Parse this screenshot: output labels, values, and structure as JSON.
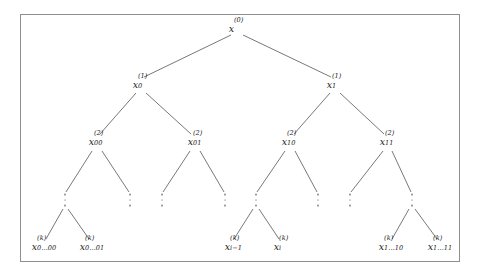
{
  "figure": {
    "frame_color": "#8e8e8e",
    "background_color": "#ffffff",
    "edge_color": "#555555",
    "text_color": "#1a1a1a",
    "width": 479,
    "height": 277
  },
  "tree": {
    "levels": [
      {
        "level": 0,
        "nodes": [
          {
            "id": "root",
            "base": "x",
            "sup": "(0)",
            "sub": "",
            "x": 236,
            "y": 29
          }
        ]
      },
      {
        "level": 1,
        "nodes": [
          {
            "id": "n0",
            "base": "x",
            "sup": "(1)",
            "sub": "0",
            "x": 140,
            "y": 85
          },
          {
            "id": "n1",
            "base": "x",
            "sup": "(1)",
            "sub": "1",
            "x": 334,
            "y": 85
          }
        ]
      },
      {
        "level": 2,
        "nodes": [
          {
            "id": "n00",
            "base": "x",
            "sup": "(2)",
            "sub": "00",
            "x": 96,
            "y": 142
          },
          {
            "id": "n01",
            "base": "x",
            "sup": "(2)",
            "sub": "01",
            "x": 195,
            "y": 142
          },
          {
            "id": "n10",
            "base": "x",
            "sup": "(2)",
            "sub": "10",
            "x": 289,
            "y": 142
          },
          {
            "id": "n11",
            "base": "x",
            "sup": "(2)",
            "sub": "11",
            "x": 387,
            "y": 142
          }
        ]
      }
    ],
    "dots": [
      {
        "id": "d1",
        "x": 65,
        "y": 200
      },
      {
        "id": "d2",
        "x": 130,
        "y": 200
      },
      {
        "id": "d3",
        "x": 162,
        "y": 200
      },
      {
        "id": "d4",
        "x": 225,
        "y": 200
      },
      {
        "id": "d5",
        "x": 256,
        "y": 200
      },
      {
        "id": "d6",
        "x": 318,
        "y": 200
      },
      {
        "id": "d7",
        "x": 350,
        "y": 200
      },
      {
        "id": "d8",
        "x": 412,
        "y": 200
      }
    ],
    "leaves": [
      {
        "id": "l1",
        "base": "x",
        "sup": "(k)",
        "sub": "0…00",
        "x": 44,
        "y": 247
      },
      {
        "id": "l2",
        "base": "x",
        "sup": "(k)",
        "sub": "0…01",
        "x": 92,
        "y": 247
      },
      {
        "id": "l3",
        "base": "x",
        "sup": "(k)",
        "sub": "i−1",
        "x": 232,
        "y": 247
      },
      {
        "id": "l4",
        "base": "x",
        "sup": "(k)",
        "sub": "i",
        "x": 281,
        "y": 247
      },
      {
        "id": "l5",
        "base": "x",
        "sup": "(k)",
        "sub": "1…10",
        "x": 391,
        "y": 247
      },
      {
        "id": "l6",
        "base": "x",
        "sup": "(k)",
        "sub": "1…11",
        "x": 440,
        "y": 247
      }
    ],
    "edges": [
      {
        "from": "root",
        "to": "n0",
        "x1": 231,
        "y1": 35,
        "x2": 144,
        "y2": 77
      },
      {
        "from": "root",
        "to": "n1",
        "x1": 243,
        "y1": 35,
        "x2": 331,
        "y2": 77
      },
      {
        "from": "n0",
        "to": "n00",
        "x1": 136,
        "y1": 93,
        "x2": 100,
        "y2": 134
      },
      {
        "from": "n0",
        "to": "n01",
        "x1": 146,
        "y1": 93,
        "x2": 191,
        "y2": 134
      },
      {
        "from": "n1",
        "to": "n10",
        "x1": 330,
        "y1": 93,
        "x2": 294,
        "y2": 134
      },
      {
        "from": "n1",
        "to": "n11",
        "x1": 340,
        "y1": 93,
        "x2": 384,
        "y2": 134
      },
      {
        "from": "n00",
        "to": "d1",
        "x1": 92,
        "y1": 151,
        "x2": 66,
        "y2": 192
      },
      {
        "from": "n00",
        "to": "d2",
        "x1": 102,
        "y1": 151,
        "x2": 129,
        "y2": 192
      },
      {
        "from": "n01",
        "to": "d3",
        "x1": 190,
        "y1": 151,
        "x2": 163,
        "y2": 192
      },
      {
        "from": "n01",
        "to": "d4",
        "x1": 200,
        "y1": 151,
        "x2": 224,
        "y2": 192
      },
      {
        "from": "n10",
        "to": "d5",
        "x1": 285,
        "y1": 151,
        "x2": 257,
        "y2": 192
      },
      {
        "from": "n10",
        "to": "d6",
        "x1": 295,
        "y1": 151,
        "x2": 317,
        "y2": 192
      },
      {
        "from": "n11",
        "to": "d7",
        "x1": 383,
        "y1": 151,
        "x2": 351,
        "y2": 192
      },
      {
        "from": "n11",
        "to": "d8",
        "x1": 392,
        "y1": 151,
        "x2": 411,
        "y2": 192
      },
      {
        "from": "d1",
        "to": "l1",
        "x1": 63,
        "y1": 209,
        "x2": 46,
        "y2": 239
      },
      {
        "from": "d1",
        "to": "l2",
        "x1": 68,
        "y1": 209,
        "x2": 89,
        "y2": 239
      },
      {
        "from": "d5",
        "to": "l3",
        "x1": 253,
        "y1": 209,
        "x2": 234,
        "y2": 239
      },
      {
        "from": "d5",
        "to": "l4",
        "x1": 259,
        "y1": 209,
        "x2": 279,
        "y2": 239
      },
      {
        "from": "d8",
        "to": "l5",
        "x1": 409,
        "y1": 209,
        "x2": 392,
        "y2": 239
      },
      {
        "from": "d8",
        "to": "l6",
        "x1": 415,
        "y1": 209,
        "x2": 437,
        "y2": 239
      }
    ]
  }
}
